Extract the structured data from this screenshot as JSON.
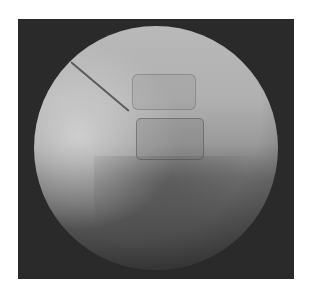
{
  "image": {
    "description": "Fluoroscopic (X-ray) image of lumbar spine with needle inserted toward vertebral body",
    "corner_mark": "·"
  },
  "colors": {
    "background": "#ffffff",
    "frame": "#2a2a2a",
    "fov_light": "#b9b9b9",
    "fov_dark": "#3c3c3c",
    "needle": "#4a4a4a"
  }
}
